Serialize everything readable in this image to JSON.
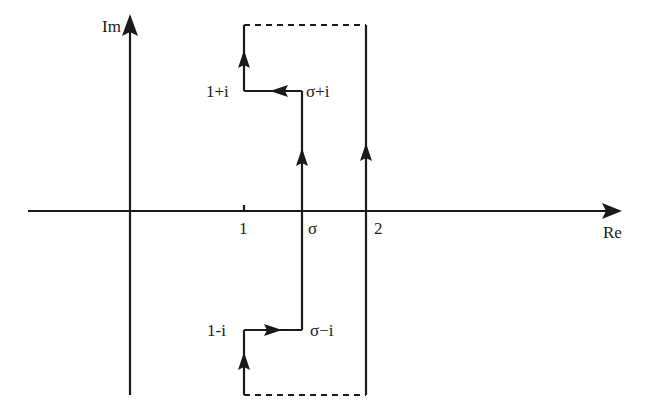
{
  "figure": {
    "type": "complex-plane contour diagram",
    "axes": {
      "x_label": "Re",
      "y_label": "Im"
    },
    "ticks": {
      "one": "1",
      "sigma": "σ",
      "two": "2"
    },
    "points": {
      "one_plus_i": "1+i",
      "sigma_plus_i": "σ+i",
      "one_minus_i": "1-i",
      "sigma_minus_i": "σ−i"
    },
    "colors": {
      "line": "#1a1a1a",
      "background": "#ffffff"
    }
  }
}
